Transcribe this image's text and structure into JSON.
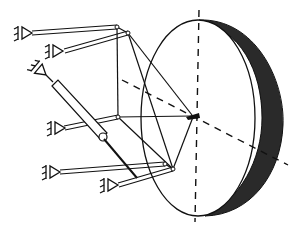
{
  "diagram": {
    "title": "Hexapod-mounted dish mechanism",
    "colors": {
      "line": "#111111",
      "dish_rim": "#222222",
      "background": "#ffffff"
    },
    "dish": {
      "center": [
        195,
        118
      ],
      "face_rx": 57,
      "face_ry": 98,
      "rim_shift": 25
    },
    "axes": {
      "vertical": {
        "from": [
          199,
          10
        ],
        "to": [
          195,
          222
        ]
      },
      "horizontal": {
        "from": [
          122,
          80
        ],
        "to": [
          285,
          163
        ]
      }
    },
    "ground_anchors": [
      {
        "id": "anchor-1",
        "at": [
          32,
          33
        ]
      },
      {
        "id": "anchor-2",
        "at": [
          63,
          51
        ]
      },
      {
        "id": "anchor-3",
        "at": [
          46,
          75
        ]
      },
      {
        "id": "anchor-4",
        "at": [
          65,
          128
        ]
      },
      {
        "id": "anchor-5",
        "at": [
          60,
          172
        ]
      },
      {
        "id": "anchor-6",
        "at": [
          118,
          185
        ]
      }
    ],
    "legs": [
      {
        "id": "leg-1",
        "from": [
          32,
          33
        ],
        "to": [
          117,
          27
        ]
      },
      {
        "id": "leg-2",
        "from": [
          63,
          51
        ],
        "to": [
          128,
          33
        ]
      },
      {
        "id": "leg-3-actuator",
        "from": [
          46,
          75
        ],
        "to": [
          103,
          137
        ]
      },
      {
        "id": "leg-4",
        "from": [
          65,
          128
        ],
        "to": [
          118,
          117
        ]
      },
      {
        "id": "leg-5",
        "from": [
          60,
          172
        ],
        "to": [
          165,
          164
        ]
      },
      {
        "id": "leg-6",
        "from": [
          118,
          185
        ],
        "to": [
          173,
          169
        ]
      }
    ],
    "frame_nodes": [
      [
        117,
        27
      ],
      [
        128,
        33
      ],
      [
        118,
        117
      ],
      [
        165,
        164
      ],
      [
        173,
        169
      ],
      [
        194,
        115
      ]
    ],
    "frame_edges": [
      [
        [
          117,
          27
        ],
        [
          128,
          33
        ]
      ],
      [
        [
          117,
          27
        ],
        [
          118,
          117
        ]
      ],
      [
        [
          128,
          33
        ],
        [
          194,
          115
        ]
      ],
      [
        [
          128,
          33
        ],
        [
          173,
          169
        ]
      ],
      [
        [
          118,
          117
        ],
        [
          194,
          115
        ]
      ],
      [
        [
          118,
          117
        ],
        [
          173,
          169
        ]
      ],
      [
        [
          165,
          164
        ],
        [
          173,
          169
        ]
      ],
      [
        [
          173,
          169
        ],
        [
          194,
          115
        ]
      ]
    ]
  }
}
